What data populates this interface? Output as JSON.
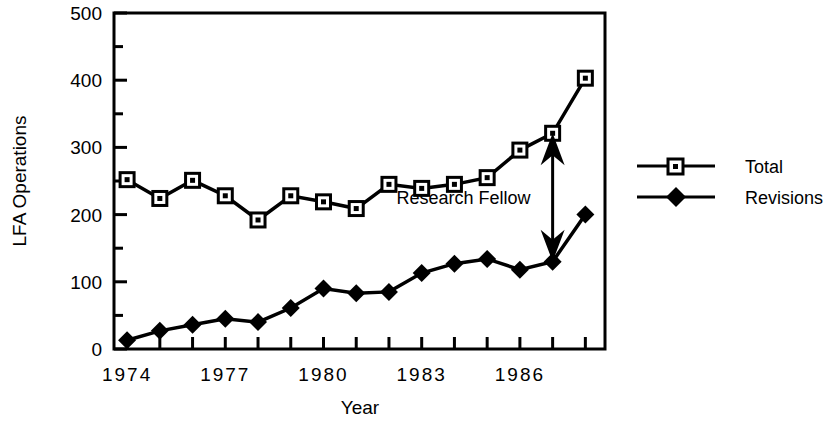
{
  "chart_data": {
    "type": "line",
    "title": "",
    "xlabel": "Year",
    "ylabel": "LFA Operations",
    "x": [
      1974,
      1975,
      1976,
      1977,
      1978,
      1979,
      1980,
      1981,
      1982,
      1983,
      1984,
      1985,
      1986,
      1987,
      1988
    ],
    "xlim": [
      1973.6,
      1988.6
    ],
    "ylim": [
      0,
      500
    ],
    "ytick_values": [
      0,
      100,
      200,
      300,
      400,
      500
    ],
    "ytick_labels": [
      "0",
      "100",
      "200",
      "300",
      "400",
      "500"
    ],
    "yminor_step": 50,
    "xtick_values": [
      1974,
      1975,
      1976,
      1977,
      1978,
      1979,
      1980,
      1981,
      1982,
      1983,
      1984,
      1985,
      1986,
      1987,
      1988
    ],
    "xtick_labels": [
      "1974",
      "",
      "",
      "1977",
      "",
      "",
      "1980",
      "",
      "",
      "1983",
      "",
      "",
      "1986",
      "",
      ""
    ],
    "grid": false,
    "legend_position": "right",
    "series": [
      {
        "name": "Total",
        "marker": "open-square",
        "values": [
          252,
          224,
          251,
          228,
          192,
          228,
          219,
          209,
          245,
          239,
          245,
          255,
          296,
          321,
          403
        ]
      },
      {
        "name": "Revisions",
        "marker": "filled-diamond",
        "values": [
          13,
          27,
          36,
          45,
          40,
          61,
          90,
          83,
          85,
          113,
          127,
          134,
          118,
          130,
          200
        ]
      }
    ],
    "annotations": [
      {
        "label": "Research Fellow",
        "type": "double-arrow",
        "x": 1987,
        "y_from": 321,
        "y_to": 130
      }
    ]
  },
  "legend": {
    "entries": [
      {
        "label": "Total"
      },
      {
        "label": "Revisions"
      }
    ]
  },
  "colors": {
    "line": "#000000",
    "background": "#ffffff",
    "marker_fill": "#ffffff"
  }
}
